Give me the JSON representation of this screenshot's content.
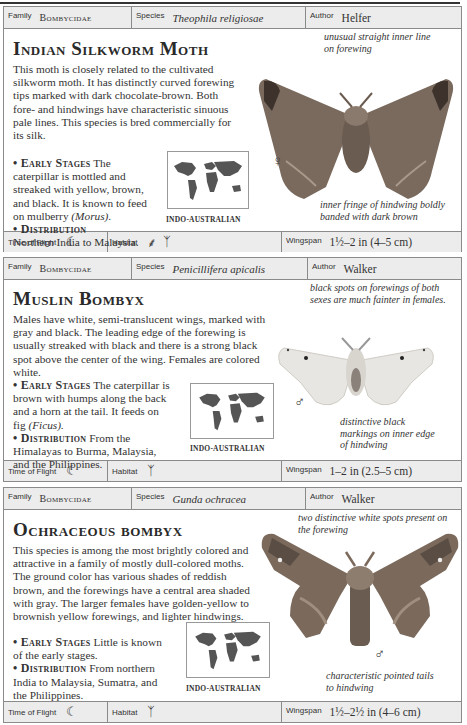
{
  "entries": [
    {
      "family_label": "Family",
      "family": "Bombycidae",
      "species_label": "Species",
      "species": "Theophila religiosae",
      "author_label": "Author",
      "author": "Helfer",
      "title": "Indian Silkworm Moth",
      "description": "This moth is closely related to the cultivated silkworm moth. It has distinctly curved forewing tips marked with dark chocolate-brown. Both fore- and hindwings have characteristic sinuous pale lines. This species is bred commercially for its silk.",
      "early_stages_label": "• Early Stages",
      "early_stages": "The caterpillar is mottled and streaked with yellow, brown, and black. It is known to feed on mulberry",
      "early_stages_italic": "(Morus).",
      "distribution_label": "• Distribution",
      "distribution": "Northern India to Malaysia.",
      "map_label": "INDO-AUSTRALIAN",
      "annotation_top": "unusual straight inner line on forewing",
      "annotation_bottom": "inner fringe of hindwing boldly banded with dark brown",
      "sex_symbol": "♀",
      "time_of_flight_label": "Time of Flight",
      "time_of_flight_icon": "moon-icon",
      "habitat_label": "Habitat",
      "habitat_icons": [
        "grass-icon",
        "palm-tree-icon"
      ],
      "wingspan_label": "Wingspan",
      "wingspan": "1½–2 in (4–5 cm)"
    },
    {
      "family_label": "Family",
      "family": "Bombycidae",
      "species_label": "Species",
      "species": "Penicillifera apicalis",
      "author_label": "Author",
      "author": "Walker",
      "title": "Muslin Bombyx",
      "description": "Males have white, semi-translucent wings, marked with gray and black. The leading edge of the forewing is usually streaked with black and there is a strong black spot above the center of the wing. Females are colored white.",
      "early_stages_label": "• Early Stages",
      "early_stages": "The caterpillar is brown with humps along the back and a horn at the tail. It feeds on fig",
      "early_stages_italic": "(Ficus).",
      "distribution_label": "• Distribution",
      "distribution": "From the Himalayas to Burma, Malaysia, and the Philippines.",
      "map_label": "INDO-AUSTRALIAN",
      "annotation_top": "black spots on forewings of both sexes are much fainter in females.",
      "annotation_bottom": "distinctive black markings on inner edge of hindwing",
      "sex_symbol": "♂",
      "time_of_flight_label": "Time of Flight",
      "time_of_flight_icon": "moon-icon",
      "habitat_label": "Habitat",
      "habitat_icons": [
        "palm-tree-icon"
      ],
      "wingspan_label": "Wingspan",
      "wingspan": "1–2 in (2.5–5 cm)"
    },
    {
      "family_label": "Family",
      "family": "Bombycidae",
      "species_label": "Species",
      "species": "Gunda ochracea",
      "author_label": "Author",
      "author": "Walker",
      "title": "Ochraceous bombyx",
      "description": "This species is among the most brightly colored and attractive in a family of mostly dull-colored moths. The ground color has various shades of reddish brown, and the forewings have a central area shaded with gray. The larger females have golden-yellow to brownish yellow forewings, and lighter hindwings.",
      "early_stages_label": "• Early Stages",
      "early_stages": "Little is known of the early stages.",
      "early_stages_italic": "",
      "distribution_label": "• Distribution",
      "distribution": "From northern India to Malaysia, Sumatra, and the Philippines.",
      "map_label": "INDO-AUSTRALIAN",
      "annotation_top": "two distinctive white spots present on the forewing",
      "annotation_bottom": "characteristic pointed tails to hindwing",
      "sex_symbol": "♂",
      "time_of_flight_label": "Time of Flight",
      "time_of_flight_icon": "moon-icon",
      "habitat_label": "Habitat",
      "habitat_icons": [
        "palm-tree-icon"
      ],
      "wingspan_label": "Wingspan",
      "wingspan": "1½–2½ in (4–6 cm)"
    }
  ],
  "colors": {
    "bar_bg": "#ececec",
    "border": "#8a8a8a",
    "text": "#333333",
    "moth1": "#7a6a5e",
    "moth2": "#e8e6e2",
    "moth3": "#7b6a5c"
  }
}
